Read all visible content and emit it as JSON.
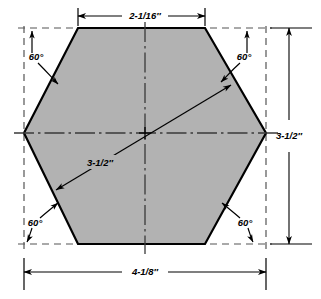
{
  "drawing": {
    "title": "Hexagon dimensioned engineering drawing",
    "shape": "regular-hexagon",
    "fill_color": "#b2b2b2",
    "outline_color": "#000000",
    "background_color": "#ffffff",
    "construction_line_color": "#4d4d4d"
  },
  "dimensions": {
    "across_flats_top": "2-1/16″",
    "across_corners_bottom": "4-1/8″",
    "height_right": "3-1/2″",
    "diagonal_across_flats": "3-1/2″"
  },
  "angles": {
    "top_left": "60°",
    "top_right": "60°",
    "bottom_left": "60°",
    "bottom_right": "60°"
  },
  "geometry": {
    "vertices": [
      {
        "name": "left",
        "x": 24,
        "y": 133
      },
      {
        "name": "top-left",
        "x": 78,
        "y": 28
      },
      {
        "name": "top-right",
        "x": 205,
        "y": 28
      },
      {
        "name": "right",
        "x": 266,
        "y": 133
      },
      {
        "name": "bottom-right",
        "x": 205,
        "y": 244
      },
      {
        "name": "bottom-left",
        "x": 78,
        "y": 244
      }
    ],
    "center": {
      "x": 145,
      "y": 133
    }
  }
}
